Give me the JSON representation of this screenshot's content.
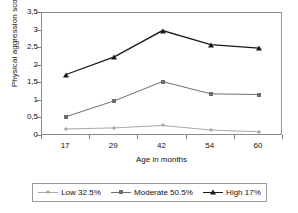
{
  "chart_data": {
    "type": "line",
    "title": "",
    "xlabel": "Age in months",
    "ylabel": "Physical aggression score",
    "categories": [
      "17",
      "29",
      "42",
      "54",
      "60"
    ],
    "x": [
      17,
      29,
      42,
      54,
      60
    ],
    "ylim": [
      0,
      3.5
    ],
    "ytick_labels": [
      "0",
      "0,5",
      "1",
      "1,5",
      "2",
      "2,5",
      "3",
      "3,5"
    ],
    "ytick_values": [
      0,
      0.5,
      1,
      1.5,
      2,
      2.5,
      3,
      3.5
    ],
    "grid": false,
    "legend_position": "bottom",
    "series": [
      {
        "name": "Low 32.5%",
        "values": [
          0.2,
          0.23,
          0.3,
          0.17,
          0.12
        ],
        "color": "#a8a8a8",
        "marker": "diamond"
      },
      {
        "name": "Moderate 50.5%",
        "values": [
          0.55,
          1.0,
          1.55,
          1.2,
          1.18
        ],
        "color": "#6e6e6e",
        "marker": "square"
      },
      {
        "name": "High 17%",
        "values": [
          1.75,
          2.25,
          3.0,
          2.6,
          2.5
        ],
        "color": "#1a1a1a",
        "marker": "triangle"
      }
    ]
  },
  "axes": {
    "y_title": "Physical aggression score",
    "x_title": "Age in months",
    "y_ticks": [
      {
        "label": "3,5"
      },
      {
        "label": "3"
      },
      {
        "label": "2,5"
      },
      {
        "label": "2"
      },
      {
        "label": "1,5"
      },
      {
        "label": "1"
      },
      {
        "label": "0,5"
      },
      {
        "label": "0"
      }
    ],
    "x_ticks": [
      {
        "label": "17"
      },
      {
        "label": "29"
      },
      {
        "label": "42"
      },
      {
        "label": "54"
      },
      {
        "label": "60"
      }
    ]
  },
  "legend": {
    "items": [
      {
        "label": "Low 32.5%",
        "color": "#a8a8a8",
        "marker": "diamond"
      },
      {
        "label": "Moderate 50.5%",
        "color": "#6e6e6e",
        "marker": "square"
      },
      {
        "label": "High 17%",
        "color": "#1a1a1a",
        "marker": "triangle"
      }
    ]
  }
}
